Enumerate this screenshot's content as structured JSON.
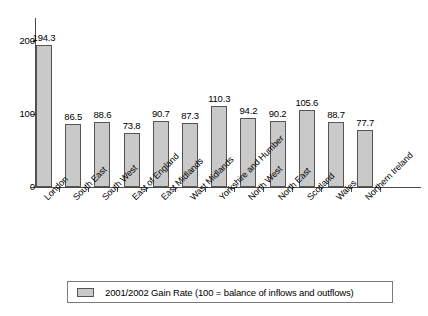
{
  "chart_data": {
    "type": "bar",
    "title": "",
    "subtitle": "",
    "xlabel": "",
    "ylabel": "",
    "ylim": [
      0,
      225
    ],
    "yticks": [
      0,
      100,
      200
    ],
    "grid": false,
    "legend_position": "bottom",
    "categories": [
      "London",
      "South East",
      "South West",
      "East of England",
      "East Midlands",
      "Wast Midlands",
      "Yorkshire and Humber",
      "North West",
      "North East",
      "Scotland",
      "Wales",
      "Northern Ireland"
    ],
    "series": [
      {
        "name": "2001/2002 Gain Rate (100 = balance of inflows and outflows)",
        "color": "#c9c9c9",
        "values": [
          194.3,
          86.5,
          88.6,
          73.8,
          90.7,
          87.3,
          110.3,
          94.2,
          90.2,
          105.6,
          88.7,
          77.7
        ]
      }
    ],
    "data_labels": [
      "194.3",
      "86.5",
      "88.6",
      "73.8",
      "90.7",
      "87.3",
      "110.3",
      "94.2",
      "90.2",
      "105.6",
      "88.7",
      "77.7"
    ]
  },
  "legend": {
    "swatch_name": "series-color-swatch",
    "label": "2001/2002 Gain Rate (100 = balance of inflows and outflows)"
  },
  "axis": {
    "y_tick_labels": [
      "200",
      "100",
      "0"
    ]
  }
}
